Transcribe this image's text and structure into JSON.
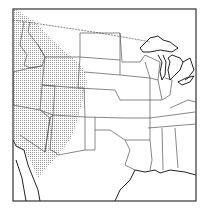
{
  "map": {
    "title": "",
    "region": "Central and Western United States",
    "shaded_region_description": "Stippled area covering the western US (WA, OR, ID, NV, UT, AZ, western MT, WY, CO, NM)",
    "colors": {
      "background": "#ffffff",
      "stipple": "#9a9a9a",
      "lines": "#555555",
      "frame": "#333333"
    },
    "legend": [],
    "labels": []
  }
}
